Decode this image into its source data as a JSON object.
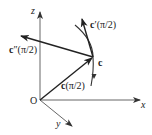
{
  "diagram": {
    "title": "",
    "axes": {
      "x_label": "x",
      "y_label": "y",
      "z_label": "z",
      "origin_label": "O"
    },
    "point_label": "c",
    "vectors": [
      {
        "id": "position",
        "label_bold": "c",
        "label_rest": "(π/2)"
      },
      {
        "id": "first_derivative",
        "label_bold": "c",
        "label_rest": "′(π/2)"
      },
      {
        "id": "second_derivative",
        "label_bold": "c",
        "label_rest": "″(π/2)"
      }
    ],
    "colors": {
      "axis": "#555555",
      "vector": "#222222",
      "text": "#1a1a1a"
    }
  }
}
